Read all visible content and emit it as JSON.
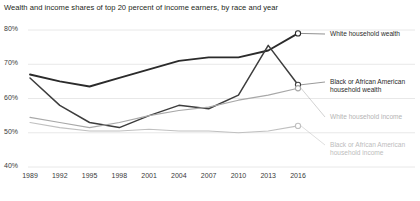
{
  "chart_data": {
    "type": "line",
    "title": "Wealth and income shares of top 20 percent of income earners, by race and year",
    "xlabel": "",
    "ylabel": "",
    "ylim": [
      40,
      80
    ],
    "ytick_values": [
      80,
      70,
      60,
      50,
      40
    ],
    "ytick_labels": [
      "80%",
      "70%",
      "60%",
      "50%",
      "40%"
    ],
    "grid": true,
    "legend_position": "right",
    "categories": [
      "1989",
      "1992",
      "1995",
      "1998",
      "2001",
      "2004",
      "2007",
      "2010",
      "2013",
      "2016"
    ],
    "x": [
      1989,
      1992,
      1995,
      1998,
      2001,
      2004,
      2007,
      2010,
      2013,
      2016
    ],
    "series": [
      {
        "name": "White household wealth",
        "color": "#2b2b2b",
        "values": [
          67.0,
          65.0,
          63.5,
          66.0,
          68.5,
          71.0,
          72.0,
          72.0,
          74.0,
          79.0
        ],
        "end_marker": true
      },
      {
        "name": "Black or African American household wealth",
        "color": "#3d3d3d",
        "values": [
          66.0,
          58.0,
          53.0,
          51.5,
          55.0,
          58.0,
          57.0,
          61.0,
          75.5,
          64.0
        ],
        "end_marker": true
      },
      {
        "name": "White household income",
        "color": "#a8a8a8",
        "values": [
          54.5,
          53.0,
          51.5,
          53.0,
          55.0,
          56.5,
          57.5,
          59.5,
          61.0,
          63.0
        ],
        "end_marker": true
      },
      {
        "name": "Black or African American household income",
        "color": "#c0c0c0",
        "values": [
          53.0,
          51.5,
          50.5,
          50.5,
          51.0,
          50.5,
          50.5,
          50.0,
          50.5,
          52.0
        ],
        "end_marker": true
      }
    ]
  },
  "legend": [
    {
      "label_line1": "White household wealth",
      "label_line2": ""
    },
    {
      "label_line1": "Black or African American",
      "label_line2": "household wealth"
    },
    {
      "label_line1": "White household income",
      "label_line2": ""
    },
    {
      "label_line1": "Black or African American",
      "label_line2": "household income"
    }
  ],
  "footnote": {
    "text": ""
  },
  "colors": {
    "axis_text": "#3a3a3a",
    "grid": "#e2e2e2",
    "background": "#ffffff"
  }
}
